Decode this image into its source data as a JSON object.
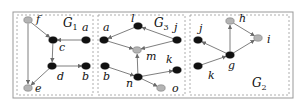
{
  "colors": {
    "dark_node": "#111111",
    "light_node": "#b4b4b4",
    "light_node_stroke": "#7a7a7a",
    "edge": "#707070",
    "frame": "#999999",
    "panel_border": "#9a9a9a"
  },
  "frame": {
    "x": 13,
    "y": 12,
    "w": 280,
    "h": 86
  },
  "panels": [
    {
      "id": "G1",
      "title_main": "G",
      "title_sub": "1",
      "title_pos": [
        63,
        27
      ],
      "box": {
        "x": 17,
        "y": 15,
        "w": 76,
        "h": 80
      },
      "nodes": [
        {
          "id": "f",
          "label": "f",
          "x": 28,
          "y": 20,
          "type": "light",
          "lx": 36,
          "ly": 23
        },
        {
          "id": "c",
          "label": "c",
          "x": 53,
          "y": 40,
          "type": "dark",
          "lx": 59,
          "ly": 51
        },
        {
          "id": "a",
          "label": "a",
          "x": 86,
          "y": 40,
          "type": "dark",
          "lx": 82,
          "ly": 31
        },
        {
          "id": "d",
          "label": "d",
          "x": 52,
          "y": 66,
          "type": "dark",
          "lx": 57,
          "ly": 80
        },
        {
          "id": "b",
          "label": "b",
          "x": 86,
          "y": 66,
          "type": "dark",
          "lx": 82,
          "ly": 80
        },
        {
          "id": "e",
          "label": "e",
          "x": 28,
          "y": 88,
          "type": "light",
          "lx": 35,
          "ly": 92
        }
      ],
      "edges": [
        {
          "from": "f",
          "to": "c"
        },
        {
          "from": "f",
          "to": "e"
        },
        {
          "from": "a",
          "to": "c"
        },
        {
          "from": "c",
          "to": "d"
        },
        {
          "from": "d",
          "to": "b"
        },
        {
          "from": "d",
          "to": "e"
        }
      ]
    },
    {
      "id": "G3",
      "title_main": "G",
      "title_sub": "3",
      "title_pos": [
        154,
        27
      ],
      "box": {
        "x": 98,
        "y": 15,
        "w": 87,
        "h": 80
      },
      "nodes": [
        {
          "id": "a",
          "label": "a",
          "x": 104,
          "y": 40,
          "type": "dark",
          "lx": 103,
          "ly": 31
        },
        {
          "id": "l",
          "label": "l",
          "x": 138,
          "y": 26,
          "type": "dark",
          "lx": 131,
          "ly": 22
        },
        {
          "id": "j",
          "label": "j",
          "x": 177,
          "y": 40,
          "type": "dark",
          "lx": 174,
          "ly": 31
        },
        {
          "id": "m",
          "label": "m",
          "x": 137,
          "y": 50,
          "type": "light",
          "lx": 146,
          "ly": 60
        },
        {
          "id": "b",
          "label": "b",
          "x": 105,
          "y": 66,
          "type": "dark",
          "lx": 103,
          "ly": 80
        },
        {
          "id": "n",
          "label": "n",
          "x": 138,
          "y": 77,
          "type": "dark",
          "lx": 126,
          "ly": 87
        },
        {
          "id": "k",
          "label": "k",
          "x": 177,
          "y": 70,
          "type": "dark",
          "lx": 166,
          "ly": 63
        },
        {
          "id": "o",
          "label": "o",
          "x": 161,
          "y": 88,
          "type": "light",
          "lx": 172,
          "ly": 92
        }
      ],
      "edges": [
        {
          "from": "l",
          "to": "a"
        },
        {
          "from": "j",
          "to": "l"
        },
        {
          "from": "a",
          "to": "m"
        },
        {
          "from": "j",
          "to": "m"
        },
        {
          "from": "n",
          "to": "m"
        },
        {
          "from": "b",
          "to": "n"
        },
        {
          "from": "n",
          "to": "k"
        },
        {
          "from": "n",
          "to": "o"
        }
      ]
    },
    {
      "id": "G2",
      "title_main": "G",
      "title_sub": "2",
      "title_pos": [
        252,
        87
      ],
      "box": {
        "x": 190,
        "y": 15,
        "w": 99,
        "h": 80
      },
      "nodes": [
        {
          "id": "h",
          "label": "h",
          "x": 230,
          "y": 21,
          "type": "light",
          "lx": 239,
          "ly": 22
        },
        {
          "id": "i",
          "label": "i",
          "x": 258,
          "y": 38,
          "type": "light",
          "lx": 267,
          "ly": 43
        },
        {
          "id": "j",
          "label": "j",
          "x": 198,
          "y": 40,
          "type": "dark",
          "lx": 199,
          "ly": 32
        },
        {
          "id": "g",
          "label": "g",
          "x": 230,
          "y": 55,
          "type": "dark",
          "lx": 228,
          "ly": 69
        },
        {
          "id": "k",
          "label": "k",
          "x": 198,
          "y": 66,
          "type": "dark",
          "lx": 208,
          "ly": 79
        }
      ],
      "edges": [
        {
          "from": "k",
          "to": "g"
        },
        {
          "from": "g",
          "to": "j"
        },
        {
          "from": "g",
          "to": "h"
        },
        {
          "from": "g",
          "to": "i"
        },
        {
          "from": "h",
          "to": "i"
        }
      ]
    }
  ]
}
